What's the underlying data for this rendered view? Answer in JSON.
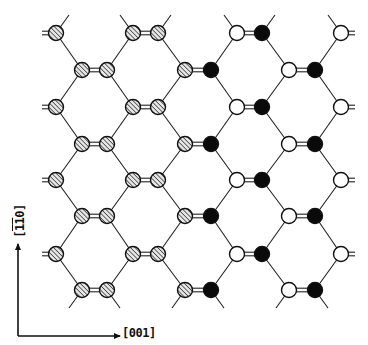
{
  "figure": {
    "type": "crystal-lattice-diagram",
    "colors": {
      "bond": "#222222",
      "outline": "#111111",
      "black_atom": "#0a0a0a",
      "white_atom": "#ffffff",
      "hatch_bg": "#e6e6e6",
      "hatch_line": "#222222",
      "background": "#ffffff"
    },
    "atom_radius": 7.5,
    "even_rows_y": [
      33,
      107,
      180,
      254
    ],
    "odd_rows_y": [
      70,
      144,
      216,
      290
    ],
    "columns": {
      "A": {
        "x": 56,
        "row": "even",
        "type": "hatched",
        "edge_stub": "left-double"
      },
      "B1": {
        "x": 82,
        "row": "odd",
        "type": "hatched"
      },
      "B2": {
        "x": 107,
        "row": "odd",
        "type": "hatched"
      },
      "C1": {
        "x": 133,
        "row": "even",
        "type": "hatched"
      },
      "C2": {
        "x": 158,
        "row": "even",
        "type": "hatched"
      },
      "D1": {
        "x": 185,
        "row": "odd",
        "type": "hatched"
      },
      "D2": {
        "x": 211,
        "row": "odd",
        "type": "black"
      },
      "E1": {
        "x": 237,
        "row": "even",
        "type": "white"
      },
      "E2": {
        "x": 262,
        "row": "even",
        "type": "black"
      },
      "F1": {
        "x": 289,
        "row": "odd",
        "type": "white"
      },
      "F2": {
        "x": 315,
        "row": "odd",
        "type": "black"
      },
      "G": {
        "x": 341,
        "row": "even",
        "type": "white",
        "edge_stub": "right-double"
      }
    },
    "double_bond_pairs": [
      [
        "B1",
        "B2"
      ],
      [
        "C1",
        "C2"
      ],
      [
        "D1",
        "D2"
      ],
      [
        "E1",
        "E2"
      ],
      [
        "F1",
        "F2"
      ]
    ],
    "single_bond_links": [
      [
        "A",
        "B1"
      ],
      [
        "B2",
        "C1"
      ],
      [
        "C2",
        "D1"
      ],
      [
        "D2",
        "E1"
      ],
      [
        "E2",
        "F1"
      ],
      [
        "F2",
        "G"
      ]
    ],
    "axes": {
      "origin": [
        18,
        336
      ],
      "x_arrow_end": [
        120,
        336
      ],
      "y_arrow_end": [
        18,
        244
      ],
      "x_label": "[001]",
      "y_label_parts": [
        {
          "text": "[",
          "bar": false
        },
        {
          "text": "1",
          "bar": true
        },
        {
          "text": "1",
          "bar": true
        },
        {
          "text": "0",
          "bar": false
        },
        {
          "text": "]",
          "bar": false
        }
      ],
      "y_label": "[1̄1̄0]"
    }
  }
}
